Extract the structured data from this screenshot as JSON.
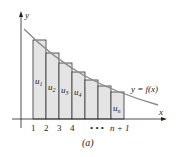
{
  "figure": {
    "caption": "(a)",
    "y_axis_label": "y",
    "x_axis_label": "x",
    "curve_label": "y = f(x)",
    "colors": {
      "curve": "#8a8a8a",
      "rect_fill": "#e4e4e4",
      "rect_stroke": "#333333",
      "axis": "#222222"
    },
    "x_ticks": [
      "1",
      "2",
      "3",
      "4",
      "• • •",
      "n + 1"
    ],
    "rect_labels": [
      {
        "base": "u",
        "sub": "1"
      },
      {
        "base": "u",
        "sub": "2"
      },
      {
        "base": "u",
        "sub": "3"
      },
      {
        "base": "u",
        "sub": "4"
      },
      {
        "base": "u",
        "sub": "n"
      }
    ]
  }
}
